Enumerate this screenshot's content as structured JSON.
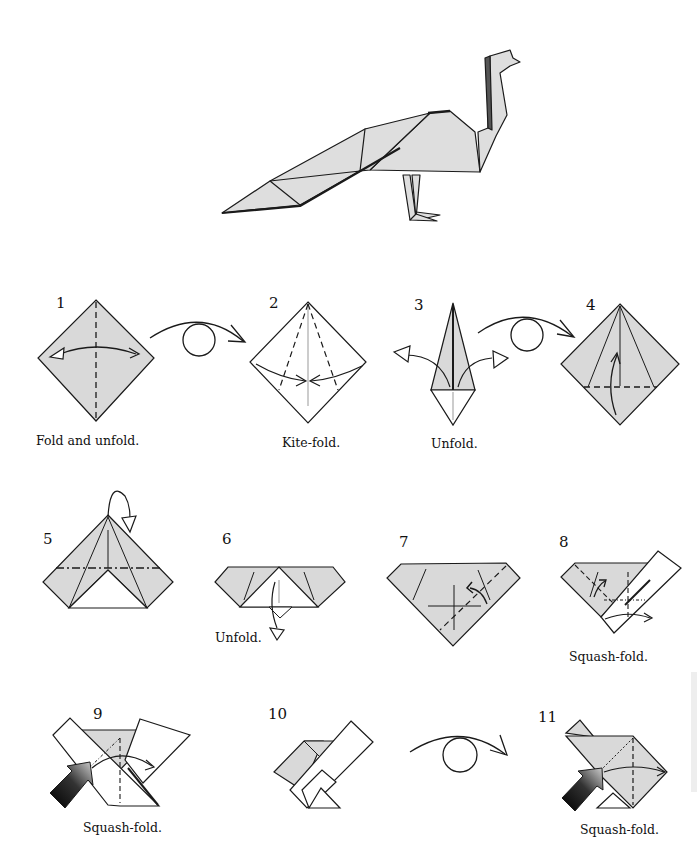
{
  "figure": {
    "fill_color": "#d9d9d9",
    "line_color": "#1a1a1a"
  },
  "steps": [
    {
      "number": "1",
      "caption": "Fold and unfold."
    },
    {
      "number": "2",
      "caption": "Kite-fold."
    },
    {
      "number": "3",
      "caption": "Unfold."
    },
    {
      "number": "4",
      "caption": ""
    },
    {
      "number": "5",
      "caption": ""
    },
    {
      "number": "6",
      "caption": "Unfold."
    },
    {
      "number": "7",
      "caption": ""
    },
    {
      "number": "8",
      "caption": "Squash-fold."
    },
    {
      "number": "9",
      "caption": "Squash-fold."
    },
    {
      "number": "10",
      "caption": ""
    },
    {
      "number": "11",
      "caption": "Squash-fold."
    }
  ],
  "symbols": {
    "turn_over": "turn-over-arrow",
    "push": "push-arrow",
    "valley_fold": "dashed-line",
    "mountain_fold": "dash-dot-line"
  }
}
